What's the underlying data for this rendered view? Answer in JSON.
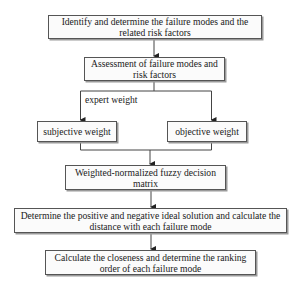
{
  "diagram": {
    "type": "flowchart",
    "nodes": [
      {
        "id": "identify",
        "label": "Identify and determine the failure modes and the related risk factors"
      },
      {
        "id": "assessment",
        "label": "Assessment of failure modes and risk factors"
      },
      {
        "id": "subjective",
        "label": "subjective weight"
      },
      {
        "id": "objective",
        "label": "objective weight"
      },
      {
        "id": "weighted",
        "label": "Weighted-normalized fuzzy decision matrix"
      },
      {
        "id": "determine",
        "label": "Determine the positive and negative ideal solution and calculate the distance with each failure mode"
      },
      {
        "id": "calculate",
        "label": "Calculate the closeness and determine the ranking order of each failure mode"
      }
    ],
    "edges": [
      {
        "from": "identify",
        "to": "assessment"
      },
      {
        "from": "assessment",
        "to": "subjective",
        "label": "expert weight"
      },
      {
        "from": "assessment",
        "to": "objective"
      },
      {
        "from": "subjective",
        "to": "weighted"
      },
      {
        "from": "objective",
        "to": "weighted"
      },
      {
        "from": "weighted",
        "to": "determine"
      },
      {
        "from": "determine",
        "to": "calculate"
      }
    ],
    "edge_label_expert": "expert weight"
  }
}
